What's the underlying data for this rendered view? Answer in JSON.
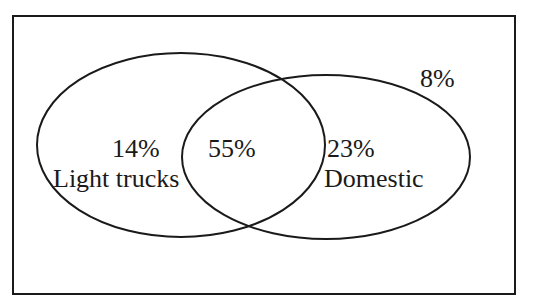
{
  "diagram": {
    "type": "venn",
    "sets": [
      {
        "name": "Light trucks",
        "only_percent": "14%"
      },
      {
        "name": "Domestic",
        "only_percent": "23%"
      }
    ],
    "intersection_percent": "55%",
    "outside_percent": "8%"
  },
  "labels": {
    "light_trucks_pct": "14%",
    "light_trucks_name": "Light trucks",
    "intersection_pct": "55%",
    "domestic_pct": "23%",
    "domestic_name": "Domestic",
    "outside_pct": "8%"
  },
  "colors": {
    "stroke": "#1a1a1a",
    "background": "#ffffff"
  }
}
